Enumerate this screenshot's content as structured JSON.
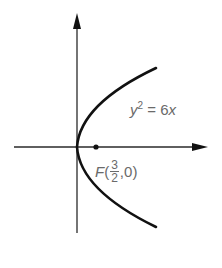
{
  "diagram": {
    "type": "parabola-graph",
    "curve": {
      "equation_label": "y² = 6x",
      "var": "y",
      "exp": "2",
      "rest": " = 6",
      "var2": "x"
    },
    "focus": {
      "name": "F",
      "x_num": "3",
      "x_den": "2",
      "y": "0",
      "open": "(",
      "sep": ",",
      "close": ")"
    },
    "colors": {
      "axis": "#1a1a1a",
      "curve": "#111111",
      "label": "#6a6a6a"
    }
  }
}
